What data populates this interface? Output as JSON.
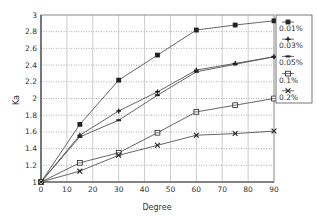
{
  "chart_data": {
    "type": "line",
    "title": "",
    "xlabel": "Degree",
    "ylabel": "Ka",
    "xlim": [
      0,
      90
    ],
    "ylim": [
      1,
      3
    ],
    "x_ticks": [
      0,
      10,
      20,
      30,
      40,
      50,
      60,
      70,
      80,
      90
    ],
    "y_ticks": [
      1,
      1.2,
      1.4,
      1.6,
      1.8,
      2,
      2.2,
      2.4,
      2.6,
      2.8,
      3
    ],
    "grid": true,
    "legend_position": "right",
    "x": [
      0,
      15,
      30,
      45,
      60,
      75,
      90
    ],
    "series": [
      {
        "name": "0.01%",
        "marker": "filled-square",
        "values": [
          1.0,
          1.69,
          2.22,
          2.52,
          2.82,
          2.88,
          2.93
        ]
      },
      {
        "name": "0.03%",
        "marker": "plus",
        "values": [
          1.0,
          1.56,
          1.85,
          2.08,
          2.34,
          2.42,
          2.5
        ]
      },
      {
        "name": "0.05%",
        "marker": "dash",
        "values": [
          1.0,
          1.54,
          1.74,
          2.04,
          2.32,
          2.41,
          2.5
        ]
      },
      {
        "name": "0.1%",
        "marker": "open-square",
        "values": [
          1.0,
          1.23,
          1.35,
          1.59,
          1.84,
          1.92,
          2.0
        ]
      },
      {
        "name": "0.2%",
        "marker": "x-cross",
        "values": [
          1.0,
          1.13,
          1.32,
          1.44,
          1.56,
          1.58,
          1.61
        ]
      }
    ]
  },
  "colors": {
    "line": "#555555",
    "grid": "#999999",
    "axis": "#444444",
    "marker": "#222222"
  }
}
